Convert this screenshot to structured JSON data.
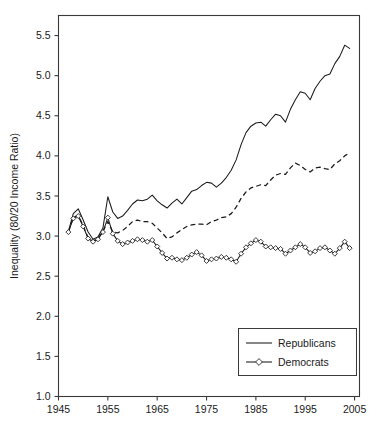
{
  "chart_data": {
    "type": "line",
    "title": "",
    "xlabel": "",
    "ylabel": "Inequality (80/20 Income Ratio)",
    "xlim": [
      1945,
      2006
    ],
    "ylim": [
      1.0,
      5.75
    ],
    "xticks": [
      1945,
      1955,
      1965,
      1975,
      1985,
      1995,
      2005
    ],
    "xtick_labels": [
      "1945",
      "1955",
      "1965",
      "1975",
      "1985",
      "1995",
      "2005"
    ],
    "yticks": [
      1.0,
      1.5,
      2.0,
      2.5,
      3.0,
      3.5,
      4.0,
      4.5,
      5.0,
      5.5
    ],
    "ytick_labels": [
      "1.0",
      "1.5",
      "2.0",
      "2.5",
      "3.0",
      "3.5",
      "4.0",
      "4.5",
      "5.0",
      "5.5"
    ],
    "grid": false,
    "legend_position": "lower right",
    "legend_entries": [
      {
        "name": "Republicans",
        "style": "solid",
        "marker": "none"
      },
      {
        "name": "Democrats",
        "style": "solid",
        "marker": "diamond"
      }
    ],
    "x": [
      1947,
      1948,
      1949,
      1950,
      1951,
      1952,
      1953,
      1954,
      1955,
      1956,
      1957,
      1958,
      1959,
      1960,
      1961,
      1962,
      1963,
      1964,
      1965,
      1966,
      1967,
      1968,
      1969,
      1970,
      1971,
      1972,
      1973,
      1974,
      1975,
      1976,
      1977,
      1978,
      1979,
      1980,
      1981,
      1982,
      1983,
      1984,
      1985,
      1986,
      1987,
      1988,
      1989,
      1990,
      1991,
      1992,
      1993,
      1994,
      1995,
      1996,
      1997,
      1998,
      1999,
      2000,
      2001,
      2002,
      2003,
      2004
    ],
    "series": [
      {
        "name": "Republicans",
        "style": "solid",
        "marker": "none",
        "values": [
          3.06,
          3.28,
          3.34,
          3.2,
          3.05,
          2.96,
          2.99,
          3.1,
          3.49,
          3.3,
          3.22,
          3.25,
          3.32,
          3.4,
          3.45,
          3.44,
          3.46,
          3.51,
          3.44,
          3.39,
          3.35,
          3.41,
          3.46,
          3.4,
          3.48,
          3.56,
          3.58,
          3.63,
          3.67,
          3.66,
          3.61,
          3.66,
          3.73,
          3.82,
          3.95,
          4.14,
          4.29,
          4.37,
          4.41,
          4.42,
          4.37,
          4.45,
          4.52,
          4.5,
          4.42,
          4.58,
          4.7,
          4.8,
          4.78,
          4.7,
          4.84,
          4.93,
          5.0,
          5.02,
          5.15,
          5.24,
          5.38,
          5.34
        ]
      },
      {
        "name": "Middle",
        "style": "dashed",
        "marker": "none",
        "values": [
          3.05,
          3.23,
          3.26,
          3.13,
          2.98,
          2.94,
          2.97,
          3.06,
          3.18,
          3.05,
          3.04,
          3.07,
          3.12,
          3.18,
          3.2,
          3.18,
          3.18,
          3.16,
          3.1,
          3.04,
          2.97,
          2.99,
          3.04,
          3.08,
          3.12,
          3.14,
          3.15,
          3.15,
          3.14,
          3.18,
          3.2,
          3.23,
          3.24,
          3.28,
          3.36,
          3.47,
          3.55,
          3.6,
          3.62,
          3.64,
          3.63,
          3.7,
          3.76,
          3.78,
          3.77,
          3.85,
          3.91,
          3.88,
          3.83,
          3.8,
          3.85,
          3.86,
          3.84,
          3.83,
          3.9,
          3.94,
          4.0,
          4.04
        ]
      },
      {
        "name": "Democrats",
        "style": "solid",
        "marker": "diamond",
        "values": [
          3.05,
          3.22,
          3.25,
          3.12,
          2.97,
          2.93,
          2.96,
          3.05,
          3.23,
          3.03,
          2.94,
          2.9,
          2.92,
          2.94,
          2.96,
          2.95,
          2.93,
          2.95,
          2.87,
          2.79,
          2.72,
          2.73,
          2.71,
          2.7,
          2.73,
          2.77,
          2.8,
          2.76,
          2.69,
          2.71,
          2.72,
          2.74,
          2.73,
          2.71,
          2.68,
          2.78,
          2.86,
          2.91,
          2.95,
          2.93,
          2.87,
          2.86,
          2.85,
          2.84,
          2.78,
          2.82,
          2.86,
          2.9,
          2.86,
          2.79,
          2.81,
          2.85,
          2.86,
          2.82,
          2.78,
          2.85,
          2.93,
          2.85
        ]
      }
    ]
  },
  "axes": {
    "ylabel": "Inequality (80/20 Income Ratio)"
  },
  "legend": {
    "republicans_label": "Republicans",
    "democrats_label": "Democrats"
  },
  "colors": {
    "line": "#1a1a1a",
    "frame": "#3a3a3a",
    "background": "#ffffff",
    "marker_fill": "#ffffff"
  }
}
